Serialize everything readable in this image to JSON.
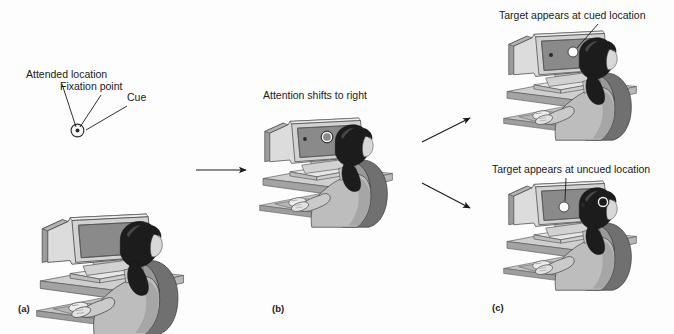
{
  "figure": {
    "type": "diagram",
    "background_color": "#fdfdfd",
    "line_color": "#1a1a1a"
  },
  "panels": [
    {
      "id": "a",
      "letter": "(a)",
      "stage_title": "",
      "callouts": [
        {
          "id": "attended-location",
          "text": "Attended location"
        },
        {
          "id": "fixation-point",
          "text": "Fixation point"
        },
        {
          "id": "cue",
          "text": "Cue"
        }
      ],
      "screen_items": [
        {
          "id": "fixation-dot",
          "kind": "dot"
        },
        {
          "id": "cue-ring",
          "kind": "ring"
        }
      ]
    },
    {
      "id": "b",
      "letter": "(b)",
      "stage_title": "Attention shifts to right",
      "callouts": [],
      "screen_items": [
        {
          "id": "fixation-dot",
          "kind": "dot"
        },
        {
          "id": "cue-ring",
          "kind": "ring"
        }
      ]
    },
    {
      "id": "c",
      "letter": "(c)",
      "stage_title": "",
      "callouts": [
        {
          "id": "target-cued",
          "text": "Target appears at cued location"
        },
        {
          "id": "target-uncued",
          "text": "Target appears at uncued location"
        }
      ],
      "screen_items": [
        {
          "id": "fixation-dot",
          "kind": "dot"
        },
        {
          "id": "target-disc",
          "kind": "disc"
        },
        {
          "id": "cue-ring",
          "kind": "ring"
        }
      ]
    }
  ],
  "arrows": [
    {
      "id": "arrow-a-to-b",
      "direction": "right"
    },
    {
      "id": "arrow-b-to-c-top",
      "direction": "up-right"
    },
    {
      "id": "arrow-b-to-c-bottom",
      "direction": "down-right"
    }
  ],
  "colors": {
    "screen_fill": "#8a8a8a",
    "monitor_body": "#d8d8d8",
    "monitor_side": "#9a9a9a",
    "desk_top": "#c9c9c9",
    "desk_edge": "#a5a5a5",
    "person_body": "#bdbdbd",
    "hair": "#1c1c1c",
    "target_white": "#fbfbfb",
    "outline": "#3a3a3a"
  }
}
